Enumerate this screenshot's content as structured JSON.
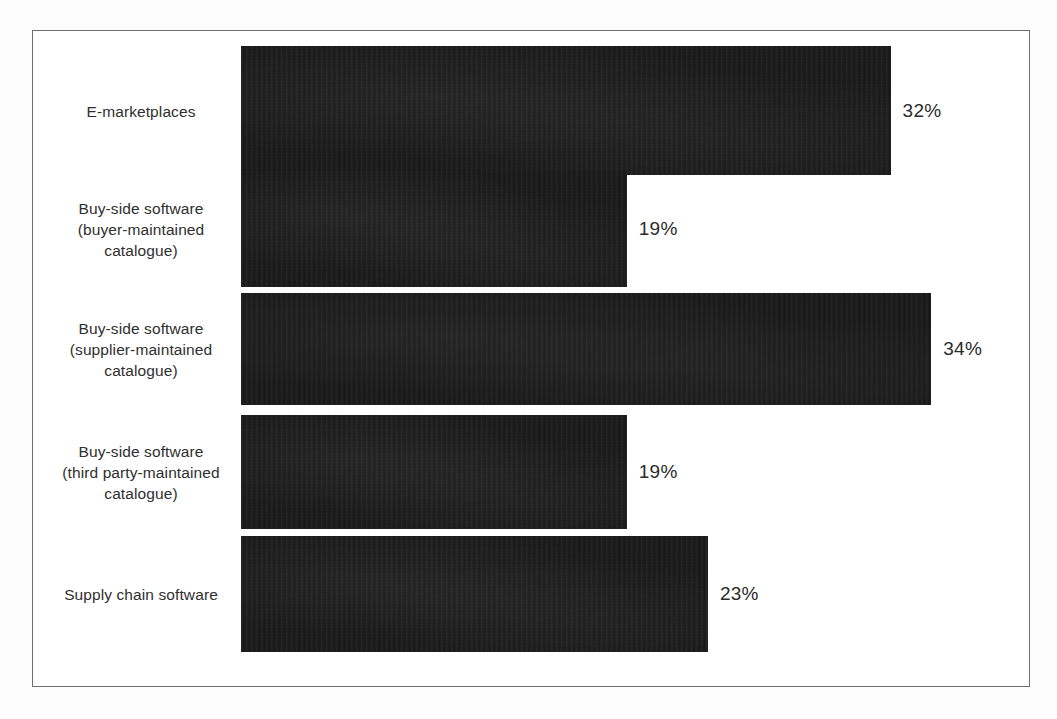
{
  "chart_data": {
    "type": "bar",
    "orientation": "horizontal",
    "title": "",
    "subtitle": "",
    "xlabel": "",
    "ylabel": "",
    "grid": false,
    "legend": null,
    "value_suffix": "%",
    "xlim": [
      0,
      34
    ],
    "categories": [
      "E-marketplaces",
      "Buy-side software (buyer-maintained catalogue)",
      "Buy-side software (supplier-maintained catalogue)",
      "Buy-side software (third party-maintained catalogue)",
      "Supply chain software"
    ],
    "values": [
      32,
      19,
      34,
      19,
      23
    ],
    "labels": [
      "32%",
      "19%",
      "34%",
      "19%",
      "23%"
    ]
  },
  "bars": [
    {
      "name": "e-marketplaces",
      "label_lines": [
        "E-marketplaces"
      ],
      "value": 32,
      "value_label": "32%"
    },
    {
      "name": "buy-side-buyer-maintained",
      "label_lines": [
        "Buy-side software",
        "(buyer-maintained",
        "catalogue)"
      ],
      "value": 19,
      "value_label": "19%"
    },
    {
      "name": "buy-side-supplier-maintained",
      "label_lines": [
        "Buy-side software",
        "(supplier-maintained",
        "catalogue)"
      ],
      "value": 34,
      "value_label": "34%"
    },
    {
      "name": "buy-side-third-party-maintained",
      "label_lines": [
        "Buy-side software",
        "(third party-maintained",
        "catalogue)"
      ],
      "value": 19,
      "value_label": "19%"
    },
    {
      "name": "supply-chain-software",
      "label_lines": [
        "Supply chain software"
      ],
      "value": 23,
      "value_label": "23%"
    }
  ],
  "style": {
    "bar_color": "#191919",
    "frame_color": "#6f6f6f",
    "label_color": "#2f2f2f",
    "value_color": "#2b2b2b",
    "background": "#ffffff"
  }
}
